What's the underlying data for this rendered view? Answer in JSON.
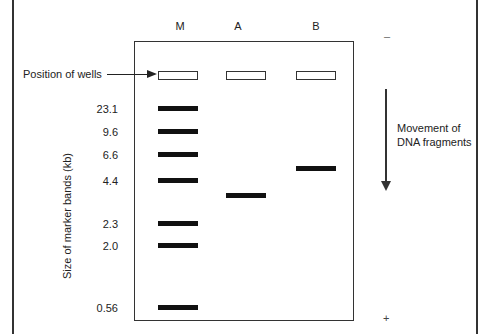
{
  "figure": {
    "type": "gel-electrophoresis",
    "lanes": [
      {
        "label": "M",
        "x": 159
      },
      {
        "label": "A",
        "x": 228
      },
      {
        "label": "B",
        "x": 296
      }
    ],
    "wells_label": "Position of wells",
    "y_axis_label": "Size of marker bands (kb)",
    "marker_sizes": [
      "23.1",
      "9.6",
      "6.6",
      "4.4",
      "2.3",
      "2.0",
      "0.56"
    ],
    "marker_band_y": [
      107,
      130,
      153,
      179,
      222,
      244,
      306
    ],
    "lane_a_band_y": 194,
    "lane_b_band_y": 167,
    "electrode_negative": "–",
    "electrode_positive": "+",
    "movement_label_line1": "Movement of",
    "movement_label_line2": "DNA fragments"
  }
}
